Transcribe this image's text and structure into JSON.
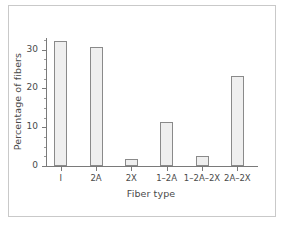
{
  "chart_data": {
    "type": "bar",
    "title": "",
    "subtitle": "",
    "xlabel": "Fiber type",
    "ylabel": "Percentage of fibers",
    "categories": [
      "I",
      "2A",
      "2X",
      "1–2A",
      "1–2A–2X",
      "2A–2X"
    ],
    "values": [
      32.3,
      30.8,
      1.7,
      11.3,
      2.6,
      23.3
    ],
    "ylim": [
      0,
      33
    ],
    "ytick_labels": [
      "0",
      "10",
      "20",
      "30"
    ],
    "ytick_values": [
      0,
      10,
      20,
      30
    ],
    "yminor_tick_values": [
      2.5,
      5,
      7.5,
      12.5,
      15,
      17.5,
      22.5,
      25,
      27.5,
      32.5
    ],
    "grid": false,
    "legend": null,
    "bar_fill_color": "#efefef",
    "bar_edge_color": "#8a8a8a",
    "axis_color": "#7a7a7a",
    "text_color": "#4a4a4a",
    "frame_color": "#c9c9c9",
    "background_color": "#ffffff"
  }
}
